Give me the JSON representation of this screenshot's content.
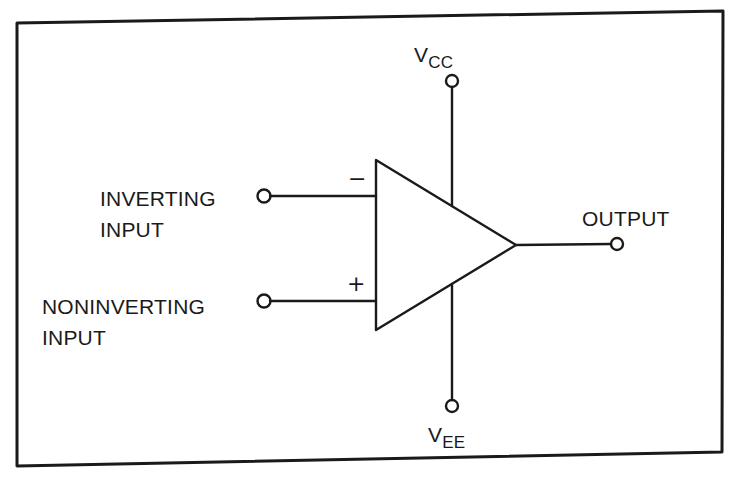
{
  "diagram": {
    "colors": {
      "stroke": "#1a1a1a",
      "background": "#ffffff"
    },
    "terminals": {
      "vcc": {
        "main": "V",
        "subscript": "CC"
      },
      "vee": {
        "main": "V",
        "subscript": "EE"
      },
      "inverting": {
        "line1": "INVERTING",
        "line2": "INPUT",
        "sign": "−"
      },
      "noninverting": {
        "line1": "NONINVERTING",
        "line2": "INPUT",
        "sign": "+"
      },
      "output": {
        "label": "OUTPUT"
      }
    }
  }
}
